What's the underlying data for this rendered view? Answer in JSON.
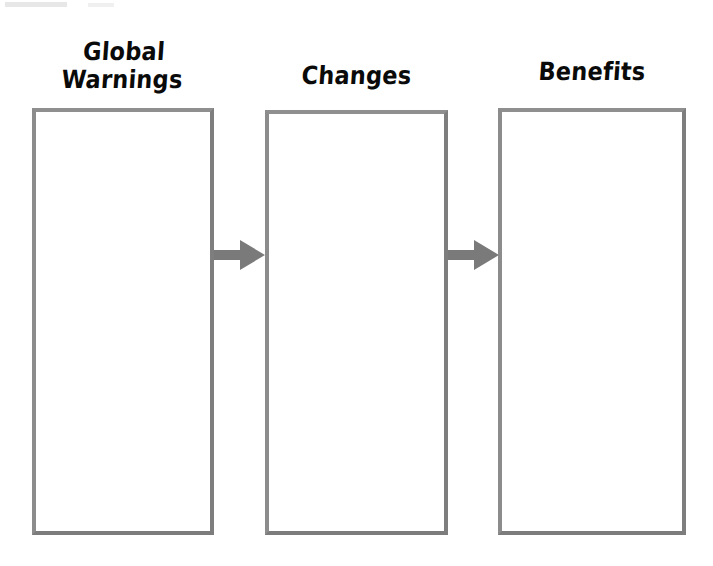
{
  "page": {
    "background_color": "#ffffff",
    "width": 713,
    "height": 566
  },
  "colors": {
    "box_border": "#8a8a8a",
    "arrow_fill": "#7a7a7a",
    "label_text": "#0a0a0a",
    "page_background": "#ffffff"
  },
  "columns": [
    {
      "id": "global-warnings",
      "label": "Global\nWarnings",
      "label_lines": [
        "Global",
        "Warnings"
      ],
      "box_content": "",
      "box": {
        "x": 32,
        "y": 108,
        "width": 182,
        "height": 427
      },
      "label_position": {
        "x": 32,
        "y": 38,
        "width": 182
      }
    },
    {
      "id": "changes",
      "label": "Changes",
      "label_lines": [
        "Changes"
      ],
      "box_content": "",
      "box": {
        "x": 265,
        "y": 110,
        "width": 183,
        "height": 425
      },
      "label_position": {
        "x": 265,
        "y": 62,
        "width": 183
      }
    },
    {
      "id": "benefits",
      "label": "Benefits",
      "label_lines": [
        "Benefits"
      ],
      "box_content": "",
      "box": {
        "x": 498,
        "y": 108,
        "width": 188,
        "height": 427
      },
      "label_position": {
        "x": 498,
        "y": 58,
        "width": 188
      }
    }
  ],
  "arrows": [
    {
      "id": "arrow-warnings-to-changes",
      "direction": "right",
      "from": "global-warnings",
      "to": "changes",
      "x": 214,
      "y": 238,
      "width": 52,
      "height": 34
    },
    {
      "id": "arrow-changes-to-benefits",
      "direction": "right",
      "from": "changes",
      "to": "benefits",
      "x": 448,
      "y": 238,
      "width": 52,
      "height": 34
    }
  ]
}
